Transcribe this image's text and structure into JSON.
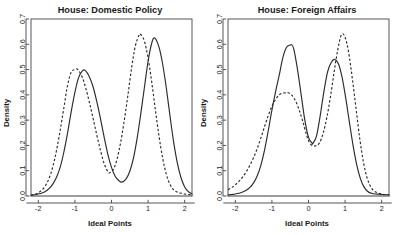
{
  "figure": {
    "background_color": "#ffffff",
    "ink_color": "#2b2b2b",
    "panel_count": 2
  },
  "chart_data": [
    {
      "type": "line",
      "title": "House: Domestic Policy",
      "xlabel": "Ideal Points",
      "ylabel": "Density",
      "xlim": [
        -2.2,
        2.2
      ],
      "ylim": [
        0.0,
        0.7
      ],
      "xticks": [
        -2,
        -1,
        0,
        1,
        2
      ],
      "xticklabels": [
        "-2",
        "-1",
        "0",
        "1",
        "2"
      ],
      "yticks": [
        0.0,
        0.1,
        0.2,
        0.3,
        0.4,
        0.5,
        0.6,
        0.7
      ],
      "yticklabels": [
        "0.0",
        "0.1",
        "0.2",
        "0.3",
        "0.4",
        "0.5",
        "0.6",
        "0.7"
      ],
      "grid": false,
      "legend": "none",
      "series": [
        {
          "name": "solid",
          "linestyle": "solid",
          "modes": [
            {
              "center": -0.72,
              "height": 0.497
            },
            {
              "center": 1.18,
              "height": 0.625
            }
          ],
          "valley": {
            "center": 0.28,
            "height": 0.055
          },
          "x": [
            -2.2,
            -2.1,
            -2.0,
            -1.9,
            -1.8,
            -1.7,
            -1.6,
            -1.5,
            -1.4,
            -1.3,
            -1.2,
            -1.1,
            -1.0,
            -0.9,
            -0.8,
            -0.72,
            -0.6,
            -0.5,
            -0.4,
            -0.3,
            -0.2,
            -0.1,
            0.0,
            0.1,
            0.2,
            0.28,
            0.4,
            0.5,
            0.6,
            0.7,
            0.8,
            0.9,
            1.0,
            1.1,
            1.18,
            1.3,
            1.4,
            1.5,
            1.6,
            1.7,
            1.8,
            1.9,
            2.0,
            2.1,
            2.2
          ],
          "y": [
            0.003,
            0.005,
            0.008,
            0.012,
            0.019,
            0.03,
            0.048,
            0.075,
            0.115,
            0.175,
            0.25,
            0.335,
            0.41,
            0.468,
            0.494,
            0.497,
            0.47,
            0.43,
            0.372,
            0.305,
            0.232,
            0.165,
            0.113,
            0.078,
            0.061,
            0.055,
            0.068,
            0.098,
            0.15,
            0.228,
            0.325,
            0.43,
            0.533,
            0.605,
            0.625,
            0.588,
            0.52,
            0.425,
            0.315,
            0.212,
            0.13,
            0.072,
            0.036,
            0.017,
            0.008
          ]
        },
        {
          "name": "dashed",
          "linestyle": "dashed",
          "modes": [
            {
              "center": -0.92,
              "height": 0.5
            },
            {
              "center": 0.8,
              "height": 0.638
            }
          ],
          "valley": {
            "center": -0.05,
            "height": 0.092
          },
          "x": [
            -2.2,
            -2.1,
            -2.0,
            -1.9,
            -1.8,
            -1.7,
            -1.6,
            -1.5,
            -1.4,
            -1.3,
            -1.2,
            -1.1,
            -1.0,
            -0.92,
            -0.8,
            -0.7,
            -0.6,
            -0.5,
            -0.4,
            -0.3,
            -0.2,
            -0.1,
            -0.05,
            0.05,
            0.15,
            0.25,
            0.35,
            0.45,
            0.55,
            0.65,
            0.75,
            0.8,
            0.9,
            1.0,
            1.1,
            1.2,
            1.3,
            1.4,
            1.5,
            1.6,
            1.7,
            1.8,
            1.9,
            2.0,
            2.1,
            2.2
          ],
          "y": [
            0.004,
            0.007,
            0.013,
            0.024,
            0.042,
            0.072,
            0.118,
            0.182,
            0.262,
            0.35,
            0.438,
            0.49,
            0.5,
            0.5,
            0.47,
            0.425,
            0.368,
            0.305,
            0.24,
            0.18,
            0.128,
            0.096,
            0.092,
            0.105,
            0.145,
            0.212,
            0.3,
            0.4,
            0.508,
            0.592,
            0.635,
            0.638,
            0.612,
            0.545,
            0.45,
            0.34,
            0.235,
            0.148,
            0.085,
            0.045,
            0.024,
            0.015,
            0.011,
            0.008,
            0.006,
            0.005
          ]
        }
      ]
    },
    {
      "type": "line",
      "title": "House: Foreign Affairs",
      "xlabel": "Ideal Points",
      "ylabel": "Density",
      "xlim": [
        -2.2,
        2.2
      ],
      "ylim": [
        0.0,
        0.7
      ],
      "xticks": [
        -2,
        -1,
        0,
        1,
        2
      ],
      "xticklabels": [
        "-2",
        "-1",
        "0",
        "1",
        "2"
      ],
      "yticks": [
        0.0,
        0.1,
        0.2,
        0.3,
        0.4,
        0.5,
        0.6,
        0.7
      ],
      "yticklabels": [
        "0.0",
        "0.1",
        "0.2",
        "0.3",
        "0.4",
        "0.5",
        "0.6",
        "0.7"
      ],
      "grid": false,
      "legend": "none",
      "series": [
        {
          "name": "solid",
          "linestyle": "solid",
          "modes": [
            {
              "center": -0.46,
              "height": 0.598
            },
            {
              "center": 0.72,
              "height": 0.54
            }
          ],
          "valley": {
            "center": 0.12,
            "height": 0.208
          },
          "x": [
            -2.2,
            -2.1,
            -2.0,
            -1.9,
            -1.8,
            -1.7,
            -1.6,
            -1.5,
            -1.4,
            -1.3,
            -1.2,
            -1.1,
            -1.0,
            -0.9,
            -0.8,
            -0.7,
            -0.6,
            -0.5,
            -0.46,
            -0.4,
            -0.3,
            -0.2,
            -0.1,
            0.0,
            0.1,
            0.12,
            0.22,
            0.32,
            0.42,
            0.52,
            0.62,
            0.72,
            0.82,
            0.92,
            1.02,
            1.12,
            1.22,
            1.32,
            1.42,
            1.52,
            1.62,
            1.72,
            1.82,
            1.92,
            2.02,
            2.12,
            2.2
          ],
          "y": [
            0.004,
            0.006,
            0.008,
            0.011,
            0.016,
            0.023,
            0.034,
            0.052,
            0.08,
            0.122,
            0.182,
            0.258,
            0.34,
            0.412,
            0.478,
            0.548,
            0.588,
            0.597,
            0.598,
            0.58,
            0.5,
            0.4,
            0.3,
            0.232,
            0.209,
            0.208,
            0.238,
            0.318,
            0.412,
            0.49,
            0.528,
            0.54,
            0.522,
            0.468,
            0.385,
            0.29,
            0.198,
            0.122,
            0.068,
            0.035,
            0.018,
            0.011,
            0.008,
            0.007,
            0.006,
            0.005,
            0.005
          ]
        },
        {
          "name": "dashed",
          "linestyle": "dashed",
          "modes": [
            {
              "center": -0.55,
              "height": 0.408
            },
            {
              "center": 0.9,
              "height": 0.638
            }
          ],
          "valley": {
            "center": 0.18,
            "height": 0.198
          },
          "x": [
            -2.2,
            -2.1,
            -2.0,
            -1.9,
            -1.8,
            -1.7,
            -1.6,
            -1.5,
            -1.4,
            -1.3,
            -1.2,
            -1.1,
            -1.0,
            -0.9,
            -0.8,
            -0.7,
            -0.6,
            -0.55,
            -0.45,
            -0.35,
            -0.25,
            -0.15,
            -0.05,
            0.05,
            0.18,
            0.3,
            0.4,
            0.5,
            0.6,
            0.7,
            0.8,
            0.9,
            1.0,
            1.1,
            1.2,
            1.3,
            1.4,
            1.5,
            1.6,
            1.7,
            1.8,
            1.9,
            2.0,
            2.1,
            2.2
          ],
          "y": [
            0.025,
            0.033,
            0.044,
            0.058,
            0.075,
            0.096,
            0.122,
            0.152,
            0.188,
            0.23,
            0.275,
            0.318,
            0.355,
            0.382,
            0.4,
            0.407,
            0.408,
            0.408,
            0.398,
            0.375,
            0.338,
            0.292,
            0.24,
            0.206,
            0.198,
            0.21,
            0.248,
            0.31,
            0.392,
            0.49,
            0.578,
            0.638,
            0.628,
            0.565,
            0.462,
            0.345,
            0.228,
            0.135,
            0.072,
            0.036,
            0.019,
            0.012,
            0.008,
            0.006,
            0.005
          ]
        }
      ]
    }
  ]
}
